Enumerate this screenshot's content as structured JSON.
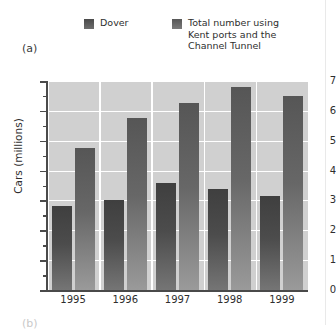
{
  "panel": {
    "label": "(a)",
    "next_label": "(b)"
  },
  "legend": {
    "items": [
      {
        "label": "Dover",
        "swatch_color": "#4a4a4a",
        "icon": "legend-swatch-icon"
      },
      {
        "label": "Total number using\nKent ports and the\nChannel Tunnel",
        "swatch_color": "#575757",
        "icon": "legend-swatch-icon"
      }
    ]
  },
  "chart_data": {
    "type": "bar",
    "title": "",
    "xlabel": "",
    "ylabel": "Cars (millions)",
    "categories": [
      "1995",
      "1996",
      "1997",
      "1998",
      "1999"
    ],
    "series": [
      {
        "name": "Dover",
        "values": [
          2.8,
          3.0,
          3.6,
          3.4,
          3.15
        ],
        "color": "#4a4a4a"
      },
      {
        "name": "Total number using Kent ports and the Channel Tunnel",
        "values": [
          4.75,
          5.75,
          6.25,
          6.8,
          6.5
        ],
        "color": "#757575"
      }
    ],
    "ylim": [
      0,
      7
    ],
    "yticks": [
      0,
      1,
      2,
      3,
      4,
      5,
      6,
      7
    ],
    "ytick_labels": [
      "0",
      "1",
      "2",
      "3",
      "4",
      "5",
      "6",
      "7"
    ],
    "minor_tick_step": 0.5,
    "grid": true,
    "grid_color": "#ffffff",
    "plot_background": "#d0d0d0",
    "legend_position": "top"
  }
}
